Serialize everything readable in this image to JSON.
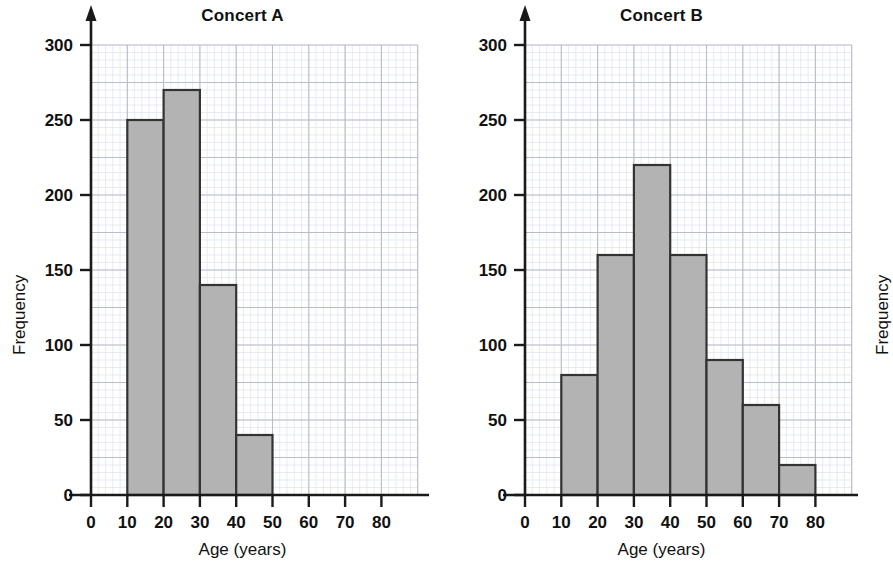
{
  "page": {
    "background_color": "#ffffff",
    "width": 858,
    "height": 576
  },
  "style": {
    "bar_fill": "#b3b3b3",
    "bar_stroke": "#333333",
    "axis_color": "#1a1a1a",
    "grid_major_color": "#b9bcc9",
    "grid_minor_color": "#dfe2ec",
    "text_color": "#111111"
  },
  "panels": [
    {
      "id": "a",
      "title": "Concert A",
      "xlabel": "Age (years)",
      "ylabel": "Frequency",
      "xticks": [
        "0",
        "10",
        "20",
        "30",
        "40",
        "50",
        "60",
        "70",
        "80"
      ],
      "yticks": [
        "0",
        "50",
        "100",
        "150",
        "200",
        "250",
        "300"
      ]
    },
    {
      "id": "b",
      "title": "Concert B",
      "xlabel": "Age (years)",
      "ylabel": "Frequency",
      "xticks": [
        "0",
        "10",
        "20",
        "30",
        "40",
        "50",
        "60",
        "70",
        "80"
      ],
      "yticks": [
        "0",
        "50",
        "100",
        "150",
        "200",
        "250",
        "300"
      ]
    }
  ],
  "chart_data": [
    {
      "type": "bar",
      "title": "Concert A",
      "xlabel": "Age (years)",
      "ylabel": "Frequency",
      "xlim": [
        0,
        80
      ],
      "ylim": [
        0,
        300
      ],
      "xticks": [
        0,
        10,
        20,
        30,
        40,
        50,
        60,
        70,
        80
      ],
      "yticks": [
        0,
        50,
        100,
        150,
        200,
        250,
        300
      ],
      "grid": true,
      "legend": "none",
      "bin_edges": [
        10,
        20,
        30,
        40,
        50
      ],
      "categories": [
        "10-20",
        "20-30",
        "30-40",
        "40-50"
      ],
      "values": [
        250,
        270,
        140,
        40
      ]
    },
    {
      "type": "bar",
      "title": "Concert B",
      "xlabel": "Age (years)",
      "ylabel": "Frequency",
      "xlim": [
        0,
        80
      ],
      "ylim": [
        0,
        300
      ],
      "xticks": [
        0,
        10,
        20,
        30,
        40,
        50,
        60,
        70,
        80
      ],
      "yticks": [
        0,
        50,
        100,
        150,
        200,
        250,
        300
      ],
      "grid": true,
      "legend": "none",
      "bin_edges": [
        10,
        20,
        30,
        40,
        50,
        60,
        70,
        80
      ],
      "categories": [
        "10-20",
        "20-30",
        "30-40",
        "40-50",
        "50-60",
        "60-70",
        "70-80"
      ],
      "values": [
        80,
        160,
        220,
        160,
        90,
        60,
        20
      ]
    }
  ]
}
